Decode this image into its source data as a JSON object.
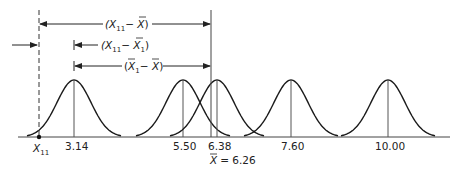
{
  "diagram": {
    "type": "sampling-distribution-deviation-diagram",
    "colors": {
      "line": "#222222",
      "mean_line": "#555555",
      "background": "#ffffff"
    },
    "baseline_y": 137,
    "curves": [
      {
        "label": "3.14",
        "center_x": 74
      },
      {
        "label": "5.50",
        "center_x": 183
      },
      {
        "label": "6.38",
        "center_x": 217
      },
      {
        "label": "7.60",
        "center_x": 291
      },
      {
        "label": "10.00",
        "center_x": 388
      }
    ],
    "observation": {
      "label": "X",
      "subscript": "11",
      "x": 39
    },
    "grand_mean": {
      "label_prefix": "X",
      "label_suffix": "= 6.26",
      "x": 211
    },
    "arrows": [
      {
        "name": "total-deviation",
        "main": "(X",
        "sub": "11",
        "mid": "− ",
        "bar": "X",
        "close": ")",
        "from_x": 39,
        "to_x": 211,
        "y": 24
      },
      {
        "name": "within-deviation",
        "main": "(X",
        "sub": "11",
        "mid": "− ",
        "bar": "X",
        "barsub": "1",
        "close": ")",
        "from_x": 74,
        "y": 45
      },
      {
        "name": "between-deviation",
        "main": "(",
        "bar1": "X",
        "bar1sub": "1",
        "mid": "− ",
        "bar": "X",
        "close": ")",
        "from_x": 74,
        "to_x": 211,
        "y": 66
      }
    ],
    "left_pointer": {
      "from_x": 12,
      "to_x": 37,
      "y": 45
    }
  }
}
